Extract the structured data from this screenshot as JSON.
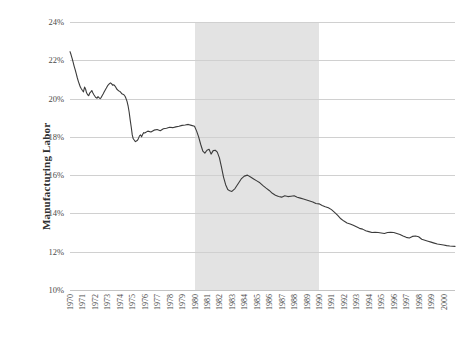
{
  "chart_data": {
    "type": "line",
    "title": "",
    "subtitle": "",
    "xlabel": "",
    "ylabel": "Manufacturing Labor",
    "ylim": [
      10,
      24
    ],
    "yticks": [
      10,
      12,
      14,
      16,
      18,
      20,
      22,
      24
    ],
    "ytick_labels": [
      "10%",
      "12%",
      "14%",
      "16%",
      "18%",
      "20%",
      "22%",
      "24%"
    ],
    "y_unit": "%",
    "xlim": [
      1970,
      2000.92
    ],
    "xticks": [
      1970,
      1971,
      1972,
      1973,
      1974,
      1975,
      1976,
      1977,
      1978,
      1979,
      1980,
      1981,
      1982,
      1983,
      1984,
      1985,
      1986,
      1987,
      1988,
      1989,
      1990,
      1991,
      1992,
      1993,
      1994,
      1995,
      1996,
      1997,
      1998,
      1999,
      2000
    ],
    "xtick_labels": [
      "1970",
      "1971",
      "1972",
      "1973",
      "1974",
      "1975",
      "1976",
      "1977",
      "1978",
      "1979",
      "1980",
      "1981",
      "1982",
      "1983",
      "1984",
      "1985",
      "1986",
      "1987",
      "1988",
      "1989",
      "1990",
      "1991",
      "1992",
      "1993",
      "1994",
      "1995",
      "1996",
      "1997",
      "1998",
      "1999",
      "2000"
    ],
    "grid": "horizontal",
    "legend": "none",
    "line_color": "#3b3b3b",
    "line_width": 1.1,
    "shaded_regions": [
      {
        "label": "",
        "x_start": 1980,
        "x_end": 1990,
        "color": "#e3e3e3"
      }
    ],
    "series": [
      {
        "name": "Manufacturing Labor",
        "color": "#3b3b3b",
        "x": [
          1970.0,
          1970.08,
          1970.17,
          1970.25,
          1970.33,
          1970.42,
          1970.5,
          1970.58,
          1970.67,
          1970.75,
          1970.83,
          1970.92,
          1971.0,
          1971.08,
          1971.17,
          1971.25,
          1971.33,
          1971.42,
          1971.5,
          1971.58,
          1971.67,
          1971.75,
          1971.83,
          1971.92,
          1972.0,
          1972.08,
          1972.17,
          1972.25,
          1972.33,
          1972.42,
          1972.5,
          1972.58,
          1972.67,
          1972.75,
          1972.83,
          1972.92,
          1973.0,
          1973.08,
          1973.17,
          1973.25,
          1973.33,
          1973.42,
          1973.5,
          1973.58,
          1973.67,
          1973.75,
          1973.83,
          1973.92,
          1974.0,
          1974.08,
          1974.17,
          1974.25,
          1974.33,
          1974.42,
          1974.5,
          1974.58,
          1974.67,
          1974.75,
          1974.83,
          1974.92,
          1975.0,
          1975.08,
          1975.17,
          1975.25,
          1975.33,
          1975.42,
          1975.5,
          1975.58,
          1975.67,
          1975.75,
          1975.83,
          1975.92,
          1976.0,
          1976.25,
          1976.5,
          1976.75,
          1977.0,
          1977.25,
          1977.5,
          1977.75,
          1978.0,
          1978.25,
          1978.5,
          1978.75,
          1979.0,
          1979.25,
          1979.5,
          1979.75,
          1980.0,
          1980.17,
          1980.33,
          1980.5,
          1980.67,
          1980.83,
          1981.0,
          1981.17,
          1981.33,
          1981.5,
          1981.67,
          1981.83,
          1982.0,
          1982.17,
          1982.33,
          1982.5,
          1982.67,
          1982.83,
          1983.0,
          1983.25,
          1983.5,
          1983.75,
          1984.0,
          1984.25,
          1984.5,
          1984.75,
          1985.0,
          1985.25,
          1985.5,
          1985.75,
          1986.0,
          1986.25,
          1986.5,
          1986.75,
          1987.0,
          1987.25,
          1987.5,
          1987.75,
          1988.0,
          1988.25,
          1988.5,
          1988.75,
          1989.0,
          1989.25,
          1989.5,
          1989.75,
          1990.0,
          1990.25,
          1990.5,
          1990.75,
          1991.0,
          1991.25,
          1991.5,
          1991.75,
          1992.0,
          1992.25,
          1992.5,
          1992.75,
          1993.0,
          1993.25,
          1993.5,
          1993.75,
          1994.0,
          1994.25,
          1994.5,
          1994.75,
          1995.0,
          1995.25,
          1995.5,
          1995.75,
          1996.0,
          1996.25,
          1996.5,
          1996.75,
          1997.0,
          1997.25,
          1997.5,
          1997.75,
          1998.0,
          1998.25,
          1998.5,
          1998.75,
          1999.0,
          1999.25,
          1999.5,
          1999.75,
          2000.0,
          2000.25,
          2000.5,
          2000.92
        ],
        "y": [
          22.45,
          22.3,
          22.1,
          21.9,
          21.7,
          21.5,
          21.3,
          21.1,
          20.9,
          20.75,
          20.6,
          20.5,
          20.42,
          20.35,
          20.6,
          20.5,
          20.3,
          20.2,
          20.15,
          20.28,
          20.35,
          20.42,
          20.3,
          20.2,
          20.12,
          20.05,
          20.02,
          20.1,
          20.05,
          20.0,
          20.05,
          20.15,
          20.25,
          20.35,
          20.45,
          20.55,
          20.65,
          20.72,
          20.78,
          20.82,
          20.78,
          20.7,
          20.72,
          20.68,
          20.6,
          20.5,
          20.45,
          20.4,
          20.38,
          20.32,
          20.25,
          20.22,
          20.2,
          20.12,
          20.0,
          19.85,
          19.6,
          19.3,
          18.9,
          18.5,
          18.1,
          17.9,
          17.82,
          17.75,
          17.78,
          17.82,
          17.92,
          18.05,
          18.1,
          18.0,
          18.12,
          18.22,
          18.2,
          18.3,
          18.25,
          18.35,
          18.38,
          18.32,
          18.42,
          18.45,
          18.5,
          18.48,
          18.52,
          18.55,
          18.6,
          18.62,
          18.65,
          18.6,
          18.55,
          18.3,
          18.0,
          17.6,
          17.25,
          17.15,
          17.3,
          17.35,
          17.1,
          17.28,
          17.3,
          17.2,
          16.9,
          16.4,
          15.9,
          15.5,
          15.25,
          15.18,
          15.15,
          15.3,
          15.55,
          15.8,
          15.95,
          16.0,
          15.9,
          15.8,
          15.7,
          15.6,
          15.45,
          15.32,
          15.2,
          15.05,
          14.95,
          14.88,
          14.85,
          14.92,
          14.88,
          14.9,
          14.92,
          14.85,
          14.8,
          14.75,
          14.7,
          14.65,
          14.6,
          14.52,
          14.5,
          14.42,
          14.35,
          14.3,
          14.2,
          14.05,
          13.9,
          13.72,
          13.6,
          13.5,
          13.45,
          13.38,
          13.3,
          13.22,
          13.18,
          13.1,
          13.05,
          13.0,
          13.02,
          13.0,
          12.98,
          12.95,
          13.0,
          13.02,
          13.0,
          12.95,
          12.9,
          12.82,
          12.75,
          12.72,
          12.8,
          12.82,
          12.78,
          12.65,
          12.6,
          12.55,
          12.5,
          12.45,
          12.4,
          12.38,
          12.35,
          12.32,
          12.3,
          12.28
        ]
      }
    ]
  }
}
